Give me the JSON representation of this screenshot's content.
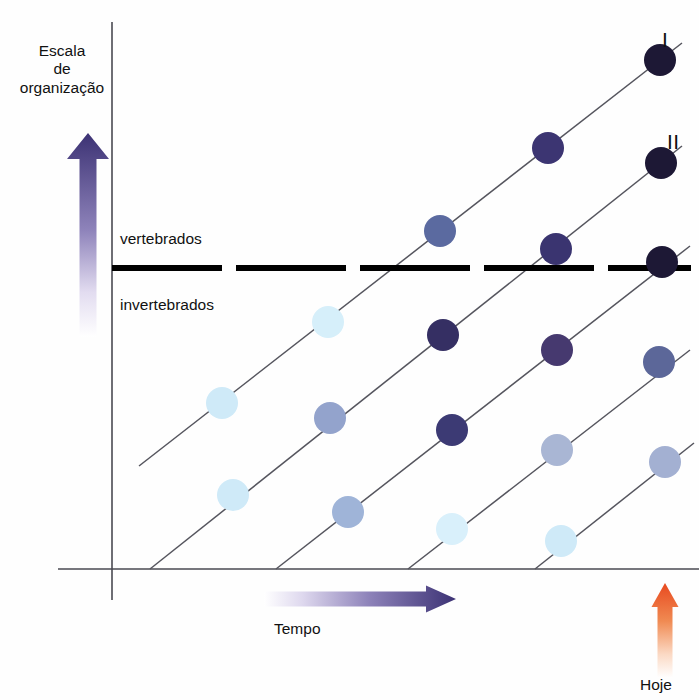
{
  "figure": {
    "type": "evolution-lineage-diagram",
    "language": "pt-BR",
    "background": "#fefefe"
  },
  "axes": {
    "y_title": "Escala\nde\norganização",
    "y_title_lines": [
      "Escala",
      "de",
      "organização"
    ],
    "x_label": "Tempo",
    "today_label": "Hoje",
    "y_axis_x": 112,
    "x_axis_y": 569,
    "x_axis_end": 699,
    "y_axis_top": 22,
    "y_axis_bottom": 600,
    "axis_color": "#4a4a52"
  },
  "zones": {
    "upper_label": "vertebrados",
    "lower_label": "invertebrados",
    "divider": {
      "y": 268,
      "x_start": 112,
      "x_end": 691,
      "color": "#000000",
      "thickness": 6,
      "dash_pattern": "110,14"
    }
  },
  "arrows": {
    "vertical": {
      "name": "escala-arrow",
      "x": 88,
      "top": 133,
      "bottom": 337,
      "color_dark": "#3c3274",
      "color_light": "#ffffff",
      "width": 17
    },
    "horizontal": {
      "name": "tempo-arrow",
      "y": 599,
      "left": 264,
      "right": 456,
      "color_dark": "#3c3274",
      "color_light": "#ffffff",
      "height": 15
    },
    "today": {
      "name": "hoje-arrow",
      "x": 665,
      "top": 583,
      "bottom": 678,
      "color_dark": "#e8491f",
      "color_light": "#ffffff",
      "width": 15
    }
  },
  "lineage_labels": [
    {
      "text": "I",
      "x": 662,
      "y": 28
    },
    {
      "text": "II",
      "x": 667,
      "y": 130
    }
  ],
  "chart_data": {
    "type": "scatter",
    "xlabel": "Tempo",
    "ylabel": "Escala de organização",
    "note": "Cinco linhagens paralelas ascendentes; a cor dos círculos escurece com o tempo (complexidade crescente).",
    "line_slope": -0.78,
    "circle_radius": 16,
    "color_scale": {
      "earliest": "#cfeaf8",
      "early": "#bcd3ee",
      "middle": "#93a3cc",
      "late": "#4b4a84",
      "latest": "#2b2450",
      "darkest": "#1d1835"
    },
    "lines": [
      {
        "id": "I",
        "label": "I",
        "start": {
          "x": 139,
          "y": 466
        },
        "end": {
          "x": 682,
          "y": 43
        },
        "points": [
          {
            "x": 222,
            "y": 403,
            "color": "#cfeaf8",
            "stage": "earliest"
          },
          {
            "x": 440,
            "y": 231,
            "color": "#5b6aa0",
            "stage": "middle"
          },
          {
            "x": 548,
            "y": 148,
            "color": "#3c3572",
            "stage": "late"
          },
          {
            "x": 660,
            "y": 60,
            "color": "#1d1835",
            "stage": "latest"
          }
        ]
      },
      {
        "id": "II",
        "label": "II",
        "start": {
          "x": 150,
          "y": 569
        },
        "end": {
          "x": 682,
          "y": 146
        },
        "points": [
          {
            "x": 233,
            "y": 495,
            "color": "#cfeaf8",
            "stage": "earliest"
          },
          {
            "x": 330,
            "y": 418,
            "color": "#93a3cc",
            "stage": "early"
          },
          {
            "x": 443,
            "y": 335,
            "color": "#352f63",
            "stage": "late"
          },
          {
            "x": 556,
            "y": 249,
            "color": "#3a3470",
            "stage": "late"
          },
          {
            "x": 661,
            "y": 163,
            "color": "#1d1835",
            "stage": "latest"
          }
        ]
      },
      {
        "id": "III",
        "label": "",
        "start": {
          "x": 276,
          "y": 569
        },
        "end": {
          "x": 690,
          "y": 246
        },
        "points": [
          {
            "x": 328,
            "y": 322,
            "color": "#d6effa",
            "stage": "earliest"
          },
          {
            "x": 348,
            "y": 512,
            "color": "#9fb4d8",
            "stage": "early"
          },
          {
            "x": 452,
            "y": 430,
            "color": "#3c3a74",
            "stage": "late"
          },
          {
            "x": 557,
            "y": 350,
            "color": "#46396f",
            "stage": "late"
          },
          {
            "x": 662,
            "y": 262,
            "color": "#1d1835",
            "stage": "latest"
          }
        ]
      },
      {
        "id": "IV",
        "label": "",
        "start": {
          "x": 408,
          "y": 569
        },
        "end": {
          "x": 690,
          "y": 350
        },
        "points": [
          {
            "x": 452,
            "y": 529,
            "color": "#d9f0fb",
            "stage": "earliest"
          },
          {
            "x": 557,
            "y": 450,
            "color": "#a9b6d4",
            "stage": "early"
          },
          {
            "x": 659,
            "y": 362,
            "color": "#5c6799",
            "stage": "middle"
          }
        ]
      },
      {
        "id": "V",
        "label": "",
        "start": {
          "x": 535,
          "y": 569
        },
        "end": {
          "x": 694,
          "y": 443
        },
        "points": [
          {
            "x": 561,
            "y": 541,
            "color": "#cfeaf8",
            "stage": "earliest"
          },
          {
            "x": 665,
            "y": 462,
            "color": "#a3b0d2",
            "stage": "early"
          }
        ]
      }
    ]
  }
}
